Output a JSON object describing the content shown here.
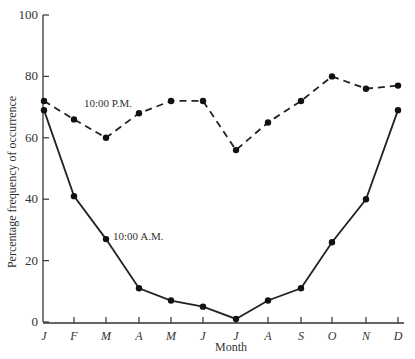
{
  "chart_data": {
    "type": "line",
    "title": "",
    "xlabel": "Month",
    "ylabel": "Percentage frequency of occurrence",
    "ylim": [
      0,
      100
    ],
    "yticks": [
      0,
      20,
      40,
      60,
      80,
      100
    ],
    "grid": false,
    "categories": [
      "J",
      "F",
      "M",
      "A",
      "M",
      "J",
      "J",
      "A",
      "S",
      "O",
      "N",
      "D"
    ],
    "series": [
      {
        "name": "10:00 P.M.",
        "style": "dashed",
        "values": [
          72,
          66,
          60,
          68,
          72,
          72,
          56,
          65,
          72,
          80,
          76,
          77
        ]
      },
      {
        "name": "10:00 A.M.",
        "style": "solid",
        "values": [
          69,
          41,
          27,
          11,
          7,
          5,
          1,
          7,
          11,
          26,
          40,
          69
        ]
      }
    ],
    "annotations": [
      {
        "text": "10:00 P.M.",
        "series": "10:00 P.M."
      },
      {
        "text": "10:00 A.M.",
        "series": "10:00 A.M."
      }
    ]
  }
}
